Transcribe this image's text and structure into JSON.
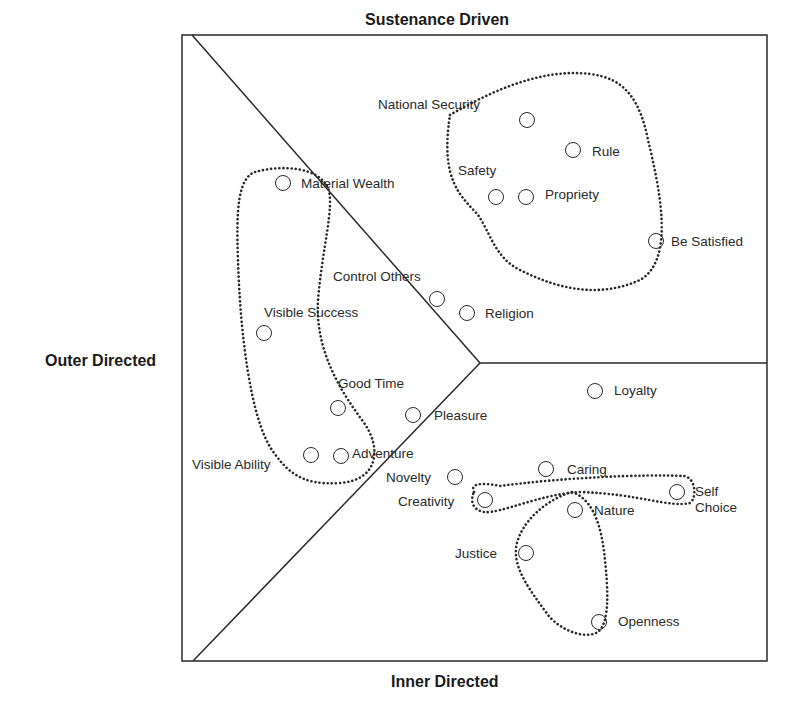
{
  "diagram": {
    "axes": {
      "top": "Sustenance Driven",
      "left": "Outer Directed",
      "bottom": "Inner Directed"
    },
    "frame": {
      "x": 182,
      "y": 35,
      "width": 585,
      "height": 626
    },
    "junction": {
      "x": 480,
      "y": 363
    },
    "colors": {
      "line": "#2a2a2a",
      "background": "#ffffff"
    },
    "nodes": [
      {
        "id": "national-security",
        "label": "National Security",
        "cx": 527,
        "cy": 120,
        "lx": 378,
        "ly": 97
      },
      {
        "id": "rule",
        "label": "Rule",
        "cx": 573,
        "cy": 150,
        "lx": 592,
        "ly": 144
      },
      {
        "id": "safety",
        "label": "Safety",
        "cx": 496,
        "cy": 197,
        "lx": 458,
        "ly": 163
      },
      {
        "id": "propriety",
        "label": "Propriety",
        "cx": 526,
        "cy": 197,
        "lx": 545,
        "ly": 187
      },
      {
        "id": "be-satisfied",
        "label": "Be Satisfied",
        "cx": 656,
        "cy": 241,
        "lx": 671,
        "ly": 234
      },
      {
        "id": "material-wealth",
        "label": "Material Wealth",
        "cx": 283,
        "cy": 183,
        "lx": 301,
        "ly": 176
      },
      {
        "id": "control-others",
        "label": "Control Others",
        "cx": 437,
        "cy": 299,
        "lx": 333,
        "ly": 269
      },
      {
        "id": "religion",
        "label": "Religion",
        "cx": 467,
        "cy": 313,
        "lx": 485,
        "ly": 306
      },
      {
        "id": "visible-success",
        "label": "Visible Success",
        "cx": 264,
        "cy": 333,
        "lx": 264,
        "ly": 305
      },
      {
        "id": "good-time",
        "label": "Good Time",
        "cx": 338,
        "cy": 408,
        "lx": 338,
        "ly": 376
      },
      {
        "id": "pleasure",
        "label": "Pleasure",
        "cx": 413,
        "cy": 415,
        "lx": 434,
        "ly": 408
      },
      {
        "id": "loyalty",
        "label": "Loyalty",
        "cx": 595,
        "cy": 391,
        "lx": 614,
        "ly": 383
      },
      {
        "id": "visible-ability",
        "label": "Visible Ability",
        "cx": 311,
        "cy": 455,
        "lx": 192,
        "ly": 457
      },
      {
        "id": "adventure",
        "label": "Adventure",
        "cx": 341,
        "cy": 456,
        "lx": 352,
        "ly": 446
      },
      {
        "id": "novelty",
        "label": "Novelty",
        "cx": 455,
        "cy": 477,
        "lx": 386,
        "ly": 470
      },
      {
        "id": "caring",
        "label": "Caring",
        "cx": 546,
        "cy": 469,
        "lx": 567,
        "ly": 462
      },
      {
        "id": "creativity",
        "label": "Creativity",
        "cx": 485,
        "cy": 500,
        "lx": 398,
        "ly": 494
      },
      {
        "id": "self-choice",
        "label": "Self\nChoice",
        "cx": 677,
        "cy": 492,
        "lx": 695,
        "ly": 484
      },
      {
        "id": "nature",
        "label": "Nature",
        "cx": 575,
        "cy": 510,
        "lx": 594,
        "ly": 503
      },
      {
        "id": "justice",
        "label": "Justice",
        "cx": 526,
        "cy": 553,
        "lx": 455,
        "ly": 546
      },
      {
        "id": "openness",
        "label": "Openness",
        "cx": 599,
        "cy": 622,
        "lx": 618,
        "ly": 614
      }
    ],
    "clusters": [
      {
        "id": "sustenance-cluster",
        "members": [
          "national-security",
          "rule",
          "safety",
          "propriety",
          "be-satisfied"
        ]
      },
      {
        "id": "outer-cluster",
        "members": [
          "material-wealth",
          "visible-success",
          "good-time",
          "visible-ability",
          "adventure"
        ]
      },
      {
        "id": "creativity-selfchoice-cluster",
        "members": [
          "creativity",
          "self-choice"
        ]
      },
      {
        "id": "justice-openness-cluster",
        "members": [
          "justice",
          "openness"
        ]
      }
    ]
  }
}
